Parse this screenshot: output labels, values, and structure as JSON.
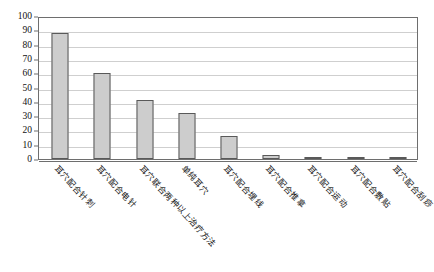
{
  "chart_data": {
    "type": "bar",
    "title": "",
    "xlabel": "",
    "ylabel": "",
    "ylim": [
      0,
      100
    ],
    "ytick_step": 10,
    "yticks": [
      100,
      90,
      80,
      70,
      60,
      50,
      40,
      30,
      20,
      10,
      0
    ],
    "grid": true,
    "legend": "none",
    "categories": [
      "耳穴配合针刺",
      "耳穴配合电针",
      "耳穴联合两种以上治疗方法",
      "单纯耳穴",
      "耳穴配合埋线",
      "耳穴配合推拿",
      "耳穴配合运动",
      "耳穴配合敷贴",
      "耳穴配合刮痧"
    ],
    "values": [
      88,
      60,
      41,
      32,
      16,
      3,
      1,
      1,
      1
    ]
  },
  "style": {
    "bar_fill": "#cdcdcd",
    "bar_border": "#595959",
    "grid_color": "#cfcfcf",
    "frame_color": "#6e6e6e",
    "background": "#ffffff"
  }
}
